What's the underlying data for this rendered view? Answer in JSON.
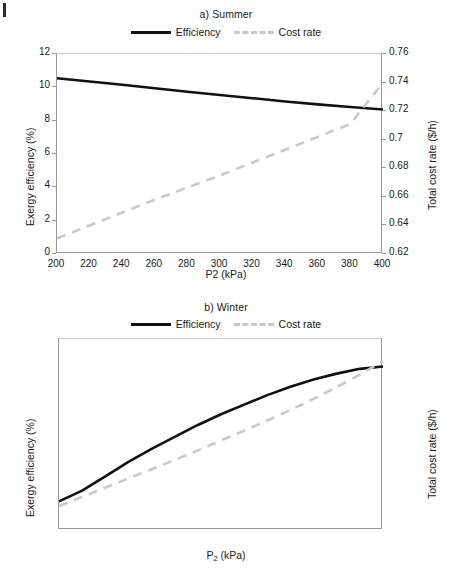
{
  "figure": {
    "corner_mark": "|",
    "legend_labels": {
      "efficiency": "Efficiency",
      "cost_rate": "Cost rate"
    },
    "colors": {
      "efficiency": "#111111",
      "cost_rate": "#c9c9c9",
      "axis": "#9a9a9a",
      "text": "#1a1a1a"
    }
  },
  "chart_data": [
    {
      "type": "line",
      "title": "a) Summer",
      "xlabel": "P2 (kPa)",
      "ylabel": "Exergy efficiency (%)",
      "y2label": "Total cost rate ($/h)",
      "xlim": [
        200,
        400
      ],
      "ylim": [
        0,
        12
      ],
      "y2lim": [
        0.62,
        0.76
      ],
      "xticks": [
        200,
        220,
        240,
        260,
        280,
        300,
        320,
        340,
        360,
        380,
        400
      ],
      "yticks": [
        0,
        2,
        4,
        6,
        8,
        10,
        12
      ],
      "y2ticks": [
        "0.62",
        "0.64",
        "0.66",
        "0.68",
        "0.7",
        "0.72",
        "0.74",
        "0.76"
      ],
      "grid": false,
      "legend_position": "top-center",
      "x": [
        200,
        220,
        240,
        260,
        280,
        300,
        320,
        340,
        360,
        380,
        400
      ],
      "series": [
        {
          "name": "Efficiency",
          "axis": "left",
          "style": "solid",
          "color": "#111111",
          "values": [
            10.55,
            10.35,
            10.15,
            9.95,
            9.74,
            9.54,
            9.35,
            9.15,
            8.98,
            8.82,
            8.67
          ]
        },
        {
          "name": "Cost rate",
          "axis": "right",
          "style": "dashed",
          "color": "#c9c9c9",
          "values": [
            0.631,
            0.64,
            0.649,
            0.658,
            0.6665,
            0.675,
            0.684,
            0.693,
            0.702,
            0.711,
            0.74
          ]
        }
      ],
      "annotations": [
        "Efficiency and Cost rate curves intersect near P2 = 368 kPa"
      ]
    },
    {
      "type": "line",
      "title": "b) Winter",
      "xlabel": "P2 (kPa)",
      "ylabel": "Exergy efficiency (%)",
      "y2label": "Total cost rate ($/h)",
      "xlim": [
        250,
        390
      ],
      "ylim": [
        13.0,
        14.6
      ],
      "y2lim": [
        0.74,
        0.8
      ],
      "xticks": [
        250,
        270,
        290,
        310,
        330,
        350,
        370,
        390
      ],
      "yticks": [
        "13.0",
        "13.2",
        "13.4",
        "13.6",
        "13.8",
        "14.0",
        "14.2",
        "14.4",
        "14.6"
      ],
      "y2ticks": [
        "0.74",
        "0.75",
        "0.76",
        "0.77",
        "0.78",
        "0.79",
        "0.8"
      ],
      "grid": false,
      "legend_position": "top-center",
      "x": [
        250,
        260,
        270,
        280,
        290,
        300,
        310,
        320,
        330,
        340,
        350,
        360,
        370,
        380,
        390
      ],
      "series": [
        {
          "name": "Efficiency",
          "axis": "left",
          "style": "solid",
          "color": "#111111",
          "values": [
            13.24,
            13.33,
            13.45,
            13.57,
            13.68,
            13.78,
            13.88,
            13.97,
            14.05,
            14.13,
            14.2,
            14.26,
            14.31,
            14.35,
            14.37
          ]
        },
        {
          "name": "Cost rate",
          "axis": "right",
          "style": "dashed",
          "color": "#c9c9c9",
          "values": [
            0.7475,
            0.7504,
            0.7533,
            0.7562,
            0.7591,
            0.762,
            0.765,
            0.7681,
            0.7712,
            0.7744,
            0.7777,
            0.7812,
            0.7849,
            0.7888,
            0.793
          ]
        }
      ],
      "annotations": [
        "Efficiency and Cost rate curves intersect near P2 = 361 kPa"
      ]
    }
  ]
}
